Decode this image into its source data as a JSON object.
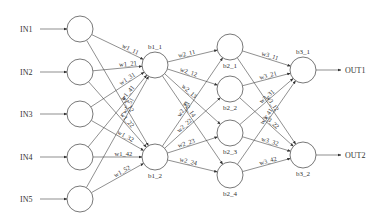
{
  "diagram": {
    "type": "neural-network",
    "colors": {
      "line": "#444444",
      "node_stroke": "#555555",
      "text": "#333333",
      "background": "#ffffff"
    },
    "inputs": [
      {
        "label": "IN1",
        "x": 80,
        "y": 29
      },
      {
        "label": "IN2",
        "x": 80,
        "y": 72
      },
      {
        "label": "IN3",
        "x": 80,
        "y": 114
      },
      {
        "label": "IN4",
        "x": 80,
        "y": 157
      },
      {
        "label": "IN5",
        "x": 80,
        "y": 199
      }
    ],
    "layer1": [
      {
        "label": "b1_1",
        "x": 155,
        "y": 65
      },
      {
        "label": "b1_2",
        "x": 155,
        "y": 157
      }
    ],
    "layer2": [
      {
        "label": "b2_1",
        "x": 230,
        "y": 47
      },
      {
        "label": "b2_2",
        "x": 230,
        "y": 89
      },
      {
        "label": "b2_3",
        "x": 230,
        "y": 133
      },
      {
        "label": "b2_4",
        "x": 230,
        "y": 175
      }
    ],
    "layer3": [
      {
        "label": "b3_1",
        "x": 303,
        "y": 70
      },
      {
        "label": "b3_2",
        "x": 303,
        "y": 155
      }
    ],
    "outputs": [
      {
        "label": "OUT1",
        "x": 345,
        "y": 70
      },
      {
        "label": "OUT2",
        "x": 345,
        "y": 155
      }
    ],
    "weights_layer1": [
      "w1_11",
      "w1_12",
      "w1_21",
      "w1_22",
      "w1_31",
      "w1_32",
      "w1_41",
      "w1_42",
      "w1_51",
      "w1_52"
    ],
    "weights_layer2": [
      "w2_11",
      "w2_12",
      "w2_13",
      "w2_14",
      "w2_21",
      "w2_22",
      "w2_23",
      "w2_24"
    ],
    "weights_layer3": [
      "w3_11",
      "w3_12",
      "w3_21",
      "w3_22",
      "w3_31",
      "w3_32",
      "w3_41",
      "w3_42"
    ]
  }
}
